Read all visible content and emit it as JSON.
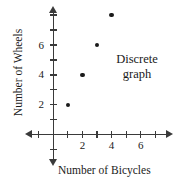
{
  "chart_data": {
    "type": "scatter",
    "title": "",
    "xlabel": "Number of Bicycles",
    "ylabel": "Number of Wheels",
    "x": [
      1,
      2,
      3,
      4
    ],
    "values": [
      2,
      4,
      6,
      8
    ],
    "points": [
      {
        "x": 1,
        "y": 2
      },
      {
        "x": 2,
        "y": 4
      },
      {
        "x": 3,
        "y": 6
      },
      {
        "x": 4,
        "y": 8
      }
    ],
    "xlim": [
      -1.6,
      7.6
    ],
    "ylim": [
      -1.5,
      8.8
    ],
    "xticks": [
      -1,
      1,
      2,
      3,
      4,
      5,
      6,
      7
    ],
    "yticks": [
      -1,
      1,
      2,
      3,
      4,
      5,
      6,
      7,
      8
    ],
    "xtick_labels": [
      "2",
      "4",
      "6"
    ],
    "xtick_label_values": [
      2,
      4,
      6
    ],
    "ytick_labels": [
      "6",
      "4",
      "2"
    ],
    "ytick_label_values": [
      6,
      4,
      2
    ],
    "grid": false,
    "legend": "none",
    "annotations": [
      {
        "text_line1": "Discrete",
        "text_line2": "graph"
      }
    ],
    "marker_color": "#1a1a1a",
    "axis_color": "#3a3a3a"
  },
  "axes": {
    "x_title": "Number of Bicycles",
    "y_title": "Number of Wheels",
    "x_labels": [
      "2",
      "4",
      "6"
    ],
    "y_labels": [
      "6",
      "4",
      "2"
    ]
  },
  "annotation": {
    "line1": "Discrete",
    "line2": "graph"
  }
}
